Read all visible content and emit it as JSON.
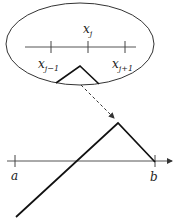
{
  "diagram": {
    "inset": {
      "shape": "ellipse",
      "axis_labels": {
        "center": {
          "base": "x",
          "sub": "j"
        },
        "left": {
          "base": "x",
          "sub": "j−1"
        },
        "right": {
          "base": "x",
          "sub": "j+1"
        }
      },
      "ticks": 3
    },
    "connector": {
      "style": "dashed-arrow",
      "from": "inset-hat",
      "to": "global-peak"
    },
    "global_axis": {
      "labels": {
        "left": "a",
        "right": "b"
      },
      "arrow": true
    },
    "colors": {
      "line": "#111111",
      "axis": "#555555",
      "ellipse": "#333333"
    }
  }
}
